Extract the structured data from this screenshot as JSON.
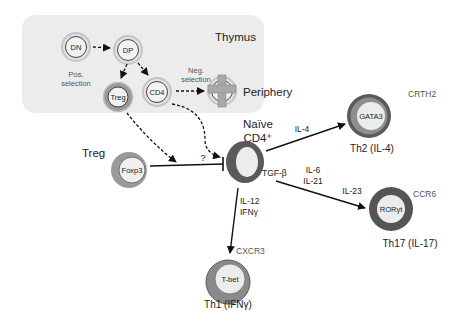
{
  "thymus": {
    "title": "Thymus",
    "cells": {
      "dn": "DN",
      "dp": "DP",
      "treg": "Treg",
      "cd4": "CD4"
    },
    "pos_selection": [
      "Pos.",
      "selection"
    ],
    "neg_selection": [
      "Neg.",
      "selection"
    ]
  },
  "periphery": {
    "label": "Periphery"
  },
  "naive": {
    "label_line1": "Naïve",
    "label_line2": "CD4⁺"
  },
  "treg_periphery": {
    "label": "Treg",
    "marker": "Foxp3",
    "inhibition_label": "?"
  },
  "th2": {
    "marker": "GATA3",
    "surface": "CRTH2",
    "label": "Th2 (IL-4)",
    "cytokine": "IL-4"
  },
  "th17": {
    "marker": "RORγt",
    "surface": "CCR6",
    "label": "Th17 (IL-17)",
    "cytokines": [
      "TGF-β",
      "IL-6",
      "IL-21",
      "IL-23"
    ]
  },
  "th1": {
    "marker": "T-bet",
    "surface": "CXCR3",
    "label": "Th1 (IFNγ)",
    "cytokines": [
      "IL-12",
      "IFNγ"
    ]
  },
  "colors": {
    "thymus_bg": "#ececec",
    "ring_light": "#c8c8c8",
    "ring_mid": "#8a8a8a",
    "ring_dark": "#555555",
    "cell_fill": "#ededed",
    "arrow": "#111111"
  }
}
